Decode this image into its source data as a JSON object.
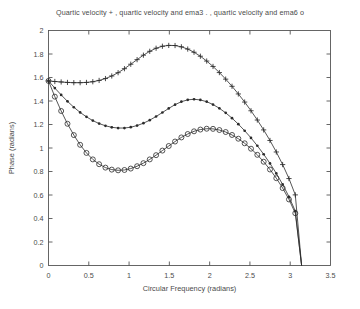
{
  "chart_data": {
    "type": "line",
    "title": "Quartic velocity + ,  quartic velocity and ema3  . , quartic velocity and ema6 o",
    "xlabel": "Circular Frequency  (radians)",
    "ylabel": "Phase  (radians)",
    "xlim": [
      0,
      3.5
    ],
    "ylim": [
      0,
      2
    ],
    "xticks": [
      "0",
      "0.5",
      "1",
      "1.5",
      "2",
      "2.5",
      "3",
      "3.5"
    ],
    "xtick_values": [
      0,
      0.5,
      1,
      1.5,
      2,
      2.5,
      3,
      3.5
    ],
    "yticks": [
      "0",
      "0.2",
      "0.4",
      "0.6",
      "0.8",
      "1",
      "1.2",
      "1.4",
      "1.6",
      "1.8",
      "2"
    ],
    "ytick_values": [
      0,
      0.2,
      0.4,
      0.6,
      0.8,
      1,
      1.2,
      1.4,
      1.6,
      1.8,
      2
    ],
    "grid": false,
    "legend_position": "title",
    "line_color": "#2b2b2b",
    "series": [
      {
        "name": "Quartic velocity",
        "marker": "plus",
        "x": [
          0.0,
          0.0785,
          0.1571,
          0.2356,
          0.3142,
          0.3927,
          0.4712,
          0.5498,
          0.6283,
          0.7069,
          0.7854,
          0.8639,
          0.9425,
          1.021,
          1.0996,
          1.1781,
          1.2566,
          1.3352,
          1.4137,
          1.4923,
          1.5708,
          1.6493,
          1.7279,
          1.8064,
          1.885,
          1.9635,
          2.042,
          2.1206,
          2.1991,
          2.2777,
          2.3562,
          2.4347,
          2.5133,
          2.5918,
          2.6704,
          2.7489,
          2.8274,
          2.906,
          2.9845,
          3.0631,
          3.1416
        ],
        "y": [
          1.571,
          1.566,
          1.562,
          1.558,
          1.556,
          1.556,
          1.558,
          1.564,
          1.575,
          1.591,
          1.613,
          1.641,
          1.675,
          1.713,
          1.752,
          1.79,
          1.823,
          1.849,
          1.866,
          1.873,
          1.872,
          1.861,
          1.842,
          1.815,
          1.781,
          1.74,
          1.694,
          1.642,
          1.586,
          1.525,
          1.46,
          1.391,
          1.317,
          1.238,
          1.154,
          1.064,
          0.966,
          0.859,
          0.74,
          0.601,
          0.0
        ]
      },
      {
        "name": "Quartic velocity and ema3",
        "marker": "dot",
        "x": [
          0.0,
          0.0785,
          0.1571,
          0.2356,
          0.3142,
          0.3927,
          0.4712,
          0.5498,
          0.6283,
          0.7069,
          0.7854,
          0.8639,
          0.9425,
          1.021,
          1.0996,
          1.1781,
          1.2566,
          1.3352,
          1.4137,
          1.4923,
          1.5708,
          1.6493,
          1.7279,
          1.8064,
          1.885,
          1.9635,
          2.042,
          2.1206,
          2.1991,
          2.2777,
          2.3562,
          2.4347,
          2.5133,
          2.5918,
          2.6704,
          2.7489,
          2.8274,
          2.906,
          2.9845,
          3.0631,
          3.1416
        ],
        "y": [
          1.571,
          1.51,
          1.452,
          1.397,
          1.347,
          1.303,
          1.265,
          1.233,
          1.208,
          1.189,
          1.176,
          1.17,
          1.17,
          1.177,
          1.191,
          1.211,
          1.237,
          1.268,
          1.302,
          1.337,
          1.369,
          1.394,
          1.41,
          1.415,
          1.409,
          1.394,
          1.37,
          1.338,
          1.299,
          1.254,
          1.203,
          1.147,
          1.086,
          1.019,
          0.947,
          0.869,
          0.784,
          0.69,
          0.585,
          0.463,
          0.0
        ]
      },
      {
        "name": "Quartic velocity and ema6",
        "marker": "circle",
        "x": [
          0.0,
          0.0785,
          0.1571,
          0.2356,
          0.3142,
          0.3927,
          0.4712,
          0.5498,
          0.6283,
          0.7069,
          0.7854,
          0.8639,
          0.9425,
          1.021,
          1.0996,
          1.1781,
          1.2566,
          1.3352,
          1.4137,
          1.4923,
          1.5708,
          1.6493,
          1.7279,
          1.8064,
          1.885,
          1.9635,
          2.042,
          2.1206,
          2.1991,
          2.2777,
          2.3562,
          2.4347,
          2.5133,
          2.5918,
          2.6704,
          2.7489,
          2.8274,
          2.906,
          2.9845,
          3.0631,
          3.1416
        ],
        "y": [
          1.571,
          1.437,
          1.315,
          1.206,
          1.11,
          1.027,
          0.958,
          0.903,
          0.862,
          0.833,
          0.816,
          0.81,
          0.813,
          0.825,
          0.845,
          0.871,
          0.903,
          0.939,
          0.978,
          1.017,
          1.055,
          1.09,
          1.119,
          1.142,
          1.157,
          1.164,
          1.163,
          1.153,
          1.136,
          1.111,
          1.079,
          1.04,
          0.994,
          0.942,
          0.883,
          0.817,
          0.743,
          0.659,
          0.562,
          0.445,
          0.0
        ]
      }
    ]
  }
}
